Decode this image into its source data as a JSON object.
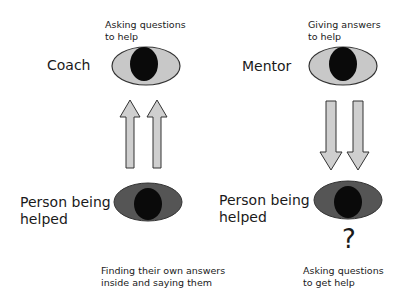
{
  "colors": {
    "background": "#ffffff",
    "eye_light": "#c8c8c8",
    "eye_dark": "#555555",
    "pupil": "#0a0a0a",
    "arrow_fill": "#cfcfcf",
    "outline": "#333333"
  },
  "left_panel": {
    "top_role": "Coach",
    "top_caption_line1": "Asking questions",
    "top_caption_line2": "to help",
    "arrow_direction": "up",
    "bottom_role_line1": "Person being",
    "bottom_role_line2": "helped",
    "bottom_caption_line1": "Finding their own answers",
    "bottom_caption_line2": "inside and saying them"
  },
  "right_panel": {
    "top_role": "Mentor",
    "top_caption_line1": "Giving answers",
    "top_caption_line2": "to help",
    "arrow_direction": "down",
    "bottom_role_line1": "Person being",
    "bottom_role_line2": "helped",
    "question_mark": "?",
    "bottom_caption_line1": "Asking questions",
    "bottom_caption_line2": "to get help"
  }
}
